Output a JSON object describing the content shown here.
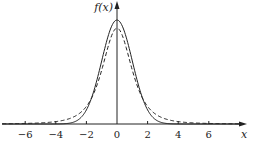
{
  "chart_data": {
    "type": "line",
    "title": "",
    "xlabel": "x",
    "ylabel": "f(x)",
    "xlim": [
      -7.5,
      8.2
    ],
    "ylim": [
      0,
      0.42
    ],
    "grid": false,
    "legend": null,
    "x_ticks": [
      -6,
      -4,
      -2,
      0,
      2,
      4,
      6
    ],
    "x_tick_labels": [
      "−6",
      "−4",
      "−2",
      "0",
      "2",
      "4",
      "6"
    ],
    "series": [
      {
        "name": "standard normal",
        "style": "solid",
        "distribution": "N(0,1)",
        "peak": 0.399,
        "x": [
          -6,
          -4,
          -3,
          -2,
          -1,
          0,
          1,
          2,
          3,
          4,
          6
        ],
        "values": [
          0.0,
          0.0001,
          0.0044,
          0.054,
          0.242,
          0.399,
          0.242,
          0.054,
          0.0044,
          0.0001,
          0.0
        ]
      },
      {
        "name": "t distribution",
        "style": "dashed",
        "distribution": "t(3)",
        "peak": 0.368,
        "x": [
          -6,
          -4,
          -3,
          -2,
          -1,
          0,
          1,
          2,
          3,
          4,
          6
        ],
        "values": [
          0.004,
          0.0092,
          0.0229,
          0.0675,
          0.2067,
          0.3676,
          0.2067,
          0.0675,
          0.0229,
          0.0092,
          0.004
        ]
      }
    ]
  },
  "axes": {
    "x_label": "x",
    "y_label": "f(x)",
    "ticks": [
      {
        "value": -6,
        "label": "−6"
      },
      {
        "value": -4,
        "label": "−4"
      },
      {
        "value": -2,
        "label": "−2"
      },
      {
        "value": 0,
        "label": "0"
      },
      {
        "value": 2,
        "label": "2"
      },
      {
        "value": 4,
        "label": "4"
      },
      {
        "value": 6,
        "label": "6"
      }
    ]
  }
}
